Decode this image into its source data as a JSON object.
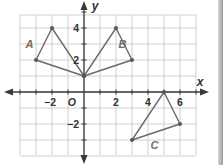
{
  "diagram": {
    "type": "coordinate-plane",
    "origin_label": "O",
    "x_axis_label": "x",
    "y_axis_label": "y",
    "x_range": [
      -4,
      7
    ],
    "y_range": [
      -4,
      5
    ],
    "x_tick_labels": [
      {
        "value": -2,
        "text": "−2"
      },
      {
        "value": 2,
        "text": "2"
      },
      {
        "value": 4,
        "text": "4"
      },
      {
        "value": 6,
        "text": "6"
      }
    ],
    "y_tick_labels": [
      {
        "value": 4,
        "text": "4"
      },
      {
        "value": 2,
        "text": "2"
      },
      {
        "value": -2,
        "text": "−2"
      }
    ],
    "shapes": [
      {
        "label": "A",
        "vertices": [
          [
            -3,
            2
          ],
          [
            -2,
            4
          ],
          [
            0,
            1
          ]
        ],
        "label_pos": [
          -3.4,
          3.0
        ]
      },
      {
        "label": "B",
        "vertices": [
          [
            0,
            1
          ],
          [
            2,
            4
          ],
          [
            3,
            2
          ]
        ],
        "label_pos": [
          2.4,
          3.0
        ]
      },
      {
        "label": "C",
        "vertices": [
          [
            5,
            0
          ],
          [
            6,
            -2
          ],
          [
            3,
            -3
          ]
        ],
        "label_pos": [
          4.4,
          -3.3
        ]
      }
    ],
    "colors": {
      "grid": "#c4c4c4",
      "axis": "#3a3a3a",
      "shape_stroke": "#6a6a6a",
      "vertex": "#555555",
      "shape_label": "#6e6e6e"
    }
  }
}
